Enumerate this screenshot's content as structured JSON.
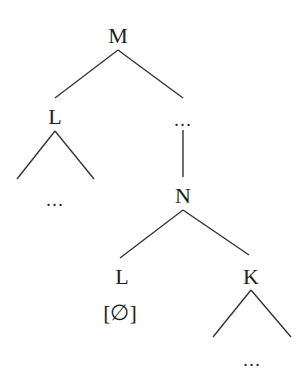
{
  "diagram": {
    "type": "syntax-tree",
    "nodes": {
      "root": {
        "label": "M"
      },
      "left_child": {
        "label": "L"
      },
      "left_child_leaf": {
        "label": "…"
      },
      "right_child": {
        "label": "…"
      },
      "n_node": {
        "label": "N"
      },
      "n_left": {
        "label": "L"
      },
      "n_left_feature": {
        "label": "[∅]"
      },
      "n_right": {
        "label": "K"
      },
      "k_leaf": {
        "label": "…"
      }
    },
    "edges": [
      [
        "M",
        "L"
      ],
      [
        "M",
        "…"
      ],
      [
        "…",
        "N"
      ],
      [
        "N",
        "L"
      ],
      [
        "N",
        "K"
      ]
    ],
    "line_color": "#333333",
    "text_color": "#222222"
  }
}
